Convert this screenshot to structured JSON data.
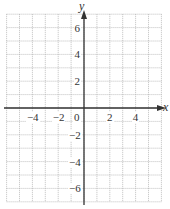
{
  "chart_data": {
    "type": "scatter",
    "title": "",
    "xlabel": "x",
    "ylabel": "y",
    "xlim": [
      -6,
      6
    ],
    "ylim": [
      -7,
      7
    ],
    "grid": true,
    "grid_style": "dotted",
    "x_ticks": [
      {
        "value": -4,
        "label": "−4"
      },
      {
        "value": -2,
        "label": "−2"
      },
      {
        "value": 0,
        "label": "0"
      },
      {
        "value": 2,
        "label": "2"
      },
      {
        "value": 4,
        "label": "4"
      }
    ],
    "y_ticks": [
      {
        "value": 6,
        "label": "6"
      },
      {
        "value": 4,
        "label": "4"
      },
      {
        "value": 2,
        "label": "2"
      },
      {
        "value": -2,
        "label": "−2"
      },
      {
        "value": -4,
        "label": "−4"
      },
      {
        "value": -6,
        "label": "−6"
      }
    ],
    "series": [],
    "colors": {
      "axis": "#333333",
      "grid": "#b0b0b0",
      "background": "#ffffff"
    }
  }
}
